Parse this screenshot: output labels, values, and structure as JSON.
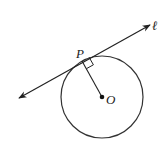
{
  "diagram": {
    "type": "geometry",
    "labels": {
      "point_p": "P",
      "point_o": "O",
      "line": "ℓ"
    },
    "circle": {
      "cx": 102,
      "cy": 97,
      "r": 41
    },
    "tangent_point": {
      "x": 82,
      "y": 61
    },
    "center": {
      "x": 102,
      "y": 97
    },
    "line": {
      "x1": 19,
      "y1": 98,
      "x2": 150,
      "y2": 25,
      "arrows": "both"
    },
    "right_angle_marker": true,
    "colors": {
      "stroke": "#222222",
      "background": "#ffffff"
    }
  }
}
